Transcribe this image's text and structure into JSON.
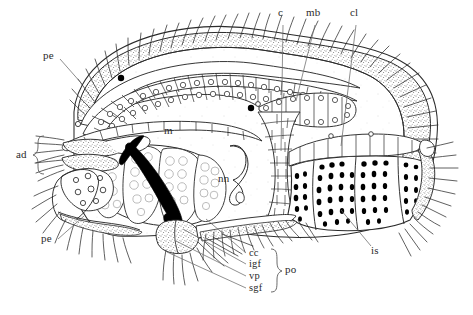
{
  "figure": {
    "domain_note": "biological longitudinal section line drawing",
    "background_color": "#ffffff",
    "ink_color": "#2b2b2b",
    "stipple_color": "#6e6e6e",
    "fill_black": "#000000"
  },
  "labels": {
    "top": [
      {
        "id": "c",
        "text": "c",
        "x": 278,
        "y": 12,
        "leader": [
          [
            283,
            26
          ],
          [
            281,
            151
          ]
        ]
      },
      {
        "id": "mb",
        "text": "mb",
        "x": 308,
        "y": 12,
        "leader": [
          [
            314,
            26
          ],
          [
            296,
            101
          ]
        ]
      },
      {
        "id": "cl",
        "text": "cl",
        "x": 350,
        "y": 12,
        "leader": [
          [
            354,
            26
          ],
          [
            341,
            146
          ]
        ]
      }
    ],
    "left": [
      {
        "id": "pe-upper",
        "text": "pe",
        "x": 43,
        "y": 55,
        "leader": [
          [
            60,
            62
          ],
          [
            80,
            83
          ]
        ]
      },
      {
        "id": "ad",
        "text": "ad",
        "x": 16,
        "y": 153,
        "leader": []
      },
      {
        "id": "pe-lower",
        "text": "pe",
        "x": 41,
        "y": 238,
        "leader": [
          [
            58,
            238
          ],
          [
            84,
            215
          ]
        ]
      }
    ],
    "interior": [
      {
        "id": "m",
        "text": "m",
        "x": 164,
        "y": 130
      },
      {
        "id": "nn",
        "text": "nn",
        "x": 219,
        "y": 178
      }
    ],
    "right": [
      {
        "id": "is",
        "text": "is",
        "x": 372,
        "y": 249,
        "leader": [
          [
            371,
            246
          ],
          [
            340,
            208
          ]
        ]
      }
    ],
    "bottom_group": {
      "items": [
        {
          "id": "cc",
          "text": "cc",
          "x": 249,
          "y": 251,
          "leader": [
            [
              247,
              255
            ],
            [
              205,
              218
            ]
          ]
        },
        {
          "id": "igf",
          "text": "igf",
          "x": 249,
          "y": 262,
          "leader": [
            [
              247,
              266
            ],
            [
              182,
              228
            ]
          ]
        },
        {
          "id": "vp",
          "text": "vp",
          "x": 249,
          "y": 274,
          "leader": [
            [
              247,
              277
            ],
            [
              175,
              240
            ]
          ]
        },
        {
          "id": "sgf",
          "text": "sgf",
          "x": 249,
          "y": 286,
          "leader": [
            [
              247,
              289
            ],
            [
              166,
              252
            ]
          ]
        }
      ],
      "bracket_label": {
        "id": "po",
        "text": "po",
        "x": 285,
        "y": 268
      }
    }
  },
  "anatomy": {
    "regions": [
      {
        "name": "cuticle-band",
        "label_ref": "c"
      },
      {
        "name": "muscle-band",
        "label_ref": "mb"
      },
      {
        "name": "cell-layer",
        "label_ref": "cl"
      },
      {
        "name": "midgut",
        "label_ref": "m"
      },
      {
        "name": "nerve-node",
        "label_ref": "nn"
      },
      {
        "name": "intestine",
        "label_ref": "is"
      },
      {
        "name": "anterior-appendages",
        "label_ref": "ad"
      },
      {
        "name": "peristomial-setae",
        "label_ref": "pe"
      },
      {
        "name": "post-oral-fields",
        "label_ref": "po"
      }
    ]
  }
}
